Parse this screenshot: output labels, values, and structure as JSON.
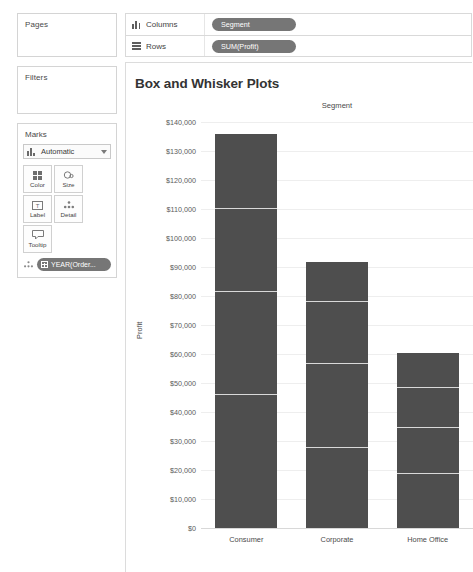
{
  "shelves": {
    "pages": {
      "title": "Pages"
    },
    "filters": {
      "title": "Filters"
    },
    "columns": {
      "label": "Columns",
      "icon": "columns-icon",
      "pill": "Segment"
    },
    "rows": {
      "label": "Rows",
      "icon": "rows-icon",
      "pill": "SUM(Profit)"
    }
  },
  "marks": {
    "title": "Marks",
    "mark_type": "Automatic",
    "mark_type_icon": "bar-mark-icon",
    "dropdown_icon": "chevron-down-icon",
    "buttons": [
      {
        "label": "Color",
        "icon": "color-palette-icon"
      },
      {
        "label": "Size",
        "icon": "size-icon"
      },
      {
        "label": "Label",
        "icon": "label-text-icon"
      },
      {
        "label": "Detail",
        "icon": "detail-dots-icon"
      },
      {
        "label": "Tooltip",
        "icon": "tooltip-icon"
      }
    ],
    "pill": {
      "text": "YEAR(Order...",
      "icon": "calendar-icon",
      "drop_icon": "detail-dots-icon"
    }
  },
  "viz": {
    "title": "Box and Whisker Plots",
    "column_header": "Segment"
  },
  "chart_data": {
    "type": "bar",
    "title": "Box and Whisker Plots",
    "xlabel": "Segment",
    "ylabel": "Profit",
    "ylim": [
      0,
      140000
    ],
    "ytick_interval": 10000,
    "grid": true,
    "legend": "none",
    "categories": [
      "Consumer",
      "Corporate",
      "Home Office"
    ],
    "values": [
      135800,
      91700,
      60300
    ],
    "ytick_labels": [
      "$140,000",
      "$130,000",
      "$120,000",
      "$110,000",
      "$100,000",
      "$90,000",
      "$80,000",
      "$70,000",
      "$60,000",
      "$50,000",
      "$40,000",
      "$30,000",
      "$20,000",
      "$10,000",
      "$0"
    ],
    "ytick_values": [
      140000,
      130000,
      120000,
      110000,
      100000,
      90000,
      80000,
      70000,
      60000,
      50000,
      40000,
      30000,
      20000,
      10000,
      0
    ],
    "stacked_segment_boundaries": [
      {
        "category": "Consumer",
        "top": 135800,
        "dividers": [
          110300,
          81700,
          46200
        ]
      },
      {
        "category": "Corporate",
        "top": 91700,
        "dividers": [
          78300,
          56900,
          27900
        ]
      },
      {
        "category": "Home Office",
        "top": 60300,
        "dividers": [
          48600,
          34800,
          19000
        ]
      }
    ],
    "bar_color": "#4e4e4e",
    "divider_color": "#d9d9d9",
    "gridline_color": "#eeeeee"
  }
}
